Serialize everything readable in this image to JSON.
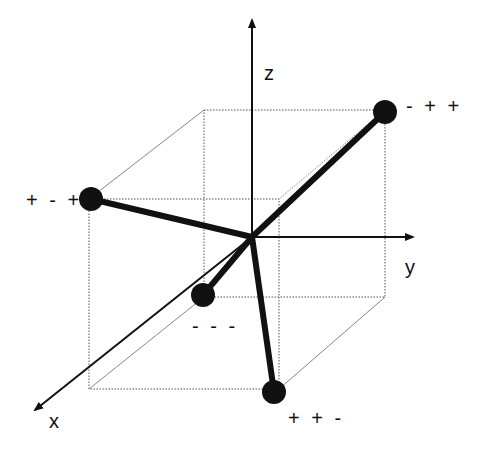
{
  "diagram": {
    "type": "3d-cube-vertex-diagram",
    "colors": {
      "axis": "#111111",
      "cube_edge": "#555555",
      "vector": "#111111",
      "node": "#111111",
      "background": "#ffffff"
    },
    "axes": {
      "z": {
        "label": "z"
      },
      "y": {
        "label": "y"
      },
      "x": {
        "label": "x"
      }
    },
    "vertices": [
      {
        "id": "v-mpp",
        "label": "- + +"
      },
      {
        "id": "v-pmp",
        "label": "+ - +"
      },
      {
        "id": "v-mmm",
        "label": "- - -"
      },
      {
        "id": "v-ppm",
        "label": "+ + -"
      }
    ]
  }
}
